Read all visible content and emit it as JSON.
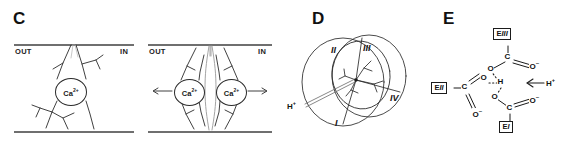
{
  "figure": {
    "panels": [
      {
        "letter": "C",
        "name": "calcium-channel-membrane-view",
        "membrane": {
          "out_label": "OUT",
          "in_label": "IN"
        },
        "subpanels": [
          {
            "name": "single-ion-occupancy",
            "ions": [
              {
                "label": "Ca",
                "charge": "2+"
              }
            ],
            "arrows": []
          },
          {
            "name": "double-ion-occupancy",
            "ions": [
              {
                "label": "Ca",
                "charge": "2+"
              },
              {
                "label": "Ca",
                "charge": "2+"
              }
            ],
            "arrows": [
              {
                "name": "efflux-arrow-left",
                "direction": "left"
              },
              {
                "name": "influx-arrow-right",
                "direction": "right"
              }
            ]
          }
        ]
      },
      {
        "letter": "D",
        "name": "pore-top-view-four-domains",
        "domains": [
          {
            "label": "I"
          },
          {
            "label": "II"
          },
          {
            "label": "III"
          },
          {
            "label": "IV"
          }
        ],
        "proton": {
          "label": "H",
          "charge": "+"
        }
      },
      {
        "letter": "E",
        "name": "glutamate-ring-hydrogen-bonding",
        "residues": [
          {
            "prefix": "E",
            "roman": "III",
            "name": "residue-e-three"
          },
          {
            "prefix": "E",
            "roman": "II",
            "name": "residue-e-two"
          },
          {
            "prefix": "E",
            "roman": "I",
            "name": "residue-e-one"
          }
        ],
        "atoms": {
          "carbon": "C",
          "oxygen": "O",
          "oxygen_anion_charge": "–",
          "hydrogen": "H"
        },
        "proton": {
          "label": "H",
          "charge": "+"
        }
      }
    ]
  },
  "colors": {
    "stroke": "#2b2b2b",
    "membrane": "#6f6f6f",
    "text": "#111111",
    "light_stroke": "#9a9a9a"
  }
}
